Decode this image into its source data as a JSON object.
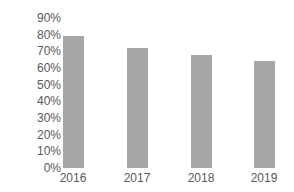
{
  "chart_data": {
    "type": "bar",
    "title": "",
    "xlabel": "",
    "ylabel": "",
    "categories": [
      "2016",
      "2017",
      "2018",
      "2019"
    ],
    "values": [
      79,
      72,
      68,
      64
    ],
    "value_format": "percent",
    "ylim": [
      0,
      90
    ],
    "yticks": [
      "0%",
      "10%",
      "20%",
      "30%",
      "40%",
      "50%",
      "60%",
      "70%",
      "80%",
      "90%"
    ],
    "grid": false,
    "legend": null,
    "bar_color": "#a6a6a6"
  }
}
